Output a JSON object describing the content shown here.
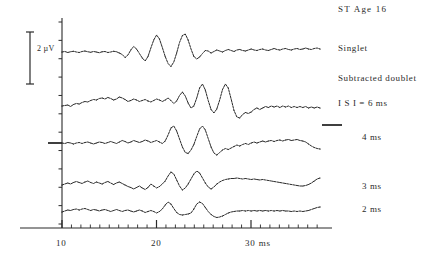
{
  "figure": {
    "title": "ST   Age 16",
    "background_color": "#ffffff",
    "ink_color": "#2a2a2a"
  },
  "scale_bar": {
    "label": "2 µV",
    "value": 2,
    "unit": "µV"
  },
  "axis": {
    "xlabel_suffix": "ms",
    "tick_labels": [
      "10",
      "20",
      "30 ms"
    ],
    "tick_values": [
      10,
      20,
      30
    ],
    "minor_tick_interval": 1,
    "x_range": [
      9,
      37
    ]
  },
  "trace_labels": [
    {
      "id": "singlet",
      "label": "Singlet"
    },
    {
      "id": "subtracted-doublet",
      "label": "Subtracted doublet"
    },
    {
      "id": "isi-6ms",
      "label": "I S I = 6 ms"
    },
    {
      "id": "isi-4ms",
      "label": "4 ms"
    },
    {
      "id": "isi-3ms",
      "label": "3 ms"
    },
    {
      "id": "isi-2ms",
      "label": "2 ms"
    }
  ],
  "chart_data": {
    "type": "line",
    "title": "ST   Age 16",
    "xlabel": "ms",
    "ylabel": "2 µV",
    "xlim": [
      9,
      37
    ],
    "grid": false,
    "legend": "right",
    "series": [
      {
        "name": "Singlet",
        "baseline_y": 52,
        "values": [
          0.0,
          0.1,
          -0.1,
          0.05,
          0.15,
          0.0,
          -0.1,
          0.1,
          0.2,
          0.05,
          -0.05,
          0.1,
          0.0,
          -0.15,
          0.05,
          0.1,
          -0.1,
          0.0,
          0.15,
          0.05,
          -0.2,
          -0.5,
          -1.1,
          -0.6,
          0.4,
          1.1,
          0.6,
          -0.3,
          -1.2,
          -1.8,
          -0.9,
          0.8,
          2.4,
          3.4,
          2.6,
          0.9,
          -0.9,
          -2.3,
          -2.9,
          -2.0,
          -0.2,
          1.9,
          3.3,
          3.6,
          2.4,
          0.6,
          -0.9,
          -1.4,
          -1.0,
          -0.3,
          0.3,
          0.2,
          -0.2,
          0.1,
          0.4,
          0.2,
          0.0,
          0.3,
          0.5,
          0.3,
          0.1,
          0.4,
          0.5,
          0.3,
          0.2,
          0.4,
          0.6,
          0.4,
          0.3,
          0.5,
          0.6,
          0.4,
          0.3,
          0.5,
          0.7,
          0.5,
          0.4,
          0.6,
          0.7,
          0.5,
          0.4,
          0.6,
          0.7,
          0.5,
          0.6,
          0.8,
          0.6,
          0.5,
          0.7,
          0.8,
          0.6
        ]
      },
      {
        "name": "I S I = 6 ms",
        "baseline_y": 105,
        "values": [
          -0.2,
          -0.1,
          0.0,
          -0.3,
          0.1,
          0.3,
          0.2,
          0.5,
          0.7,
          0.6,
          0.9,
          1.1,
          1.0,
          1.3,
          1.4,
          1.2,
          1.5,
          1.3,
          1.0,
          1.2,
          1.6,
          1.4,
          1.1,
          0.7,
          0.9,
          1.2,
          1.0,
          0.7,
          0.9,
          1.1,
          0.8,
          0.6,
          0.9,
          1.2,
          1.0,
          0.7,
          1.0,
          1.4,
          0.9,
          0.3,
          0.8,
          1.9,
          2.6,
          1.8,
          0.4,
          -0.6,
          -0.2,
          1.4,
          3.4,
          4.2,
          3.0,
          0.9,
          -0.9,
          -1.6,
          -0.8,
          1.0,
          3.1,
          4.2,
          3.4,
          1.2,
          -1.1,
          -2.4,
          -2.6,
          -1.9,
          -1.5,
          -1.7,
          -1.4,
          -0.9,
          -0.6,
          -0.9,
          -0.6,
          -0.3,
          -0.5,
          -0.2,
          -0.4,
          -0.2,
          -0.5,
          -0.2,
          -0.4,
          -0.2,
          -0.5,
          -0.3,
          -0.5,
          -0.3,
          -0.5,
          -0.3,
          -0.6,
          -0.4,
          -0.6,
          -0.4,
          -0.6
        ]
      },
      {
        "name": "4 ms",
        "baseline_y": 143,
        "has_right_marker": true,
        "has_left_marker": true,
        "values": [
          0.0,
          -0.1,
          0.1,
          0.0,
          -0.2,
          0.0,
          0.1,
          -0.1,
          0.1,
          0.2,
          0.0,
          -0.2,
          0.0,
          0.2,
          0.1,
          -0.1,
          0.1,
          0.3,
          0.1,
          -0.1,
          0.2,
          0.5,
          0.3,
          0.0,
          0.2,
          0.5,
          0.3,
          0.1,
          0.3,
          0.6,
          0.4,
          0.1,
          0.3,
          0.5,
          0.2,
          -0.1,
          0.4,
          1.6,
          3.0,
          3.4,
          2.4,
          0.8,
          -0.8,
          -1.9,
          -2.1,
          -1.4,
          -0.3,
          1.3,
          2.8,
          3.4,
          2.6,
          0.9,
          -0.8,
          -2.0,
          -2.4,
          -1.9,
          -1.4,
          -1.1,
          -1.3,
          -1.0,
          -0.7,
          -0.4,
          -0.6,
          -0.3,
          -0.1,
          -0.3,
          0.0,
          0.2,
          0.0,
          0.2,
          0.4,
          0.2,
          0.4,
          0.5,
          0.3,
          0.5,
          0.6,
          0.4,
          0.6,
          0.7,
          0.5,
          0.6,
          0.7,
          0.5,
          0.4,
          0.2,
          -0.2,
          -0.6,
          -0.9,
          -1.1,
          -1.2
        ]
      },
      {
        "name": "3 ms",
        "baseline_y": 185,
        "values": [
          0.0,
          0.2,
          0.4,
          0.2,
          0.5,
          0.7,
          0.5,
          0.3,
          0.6,
          0.8,
          0.5,
          0.3,
          0.6,
          0.4,
          0.2,
          0.5,
          0.7,
          0.4,
          0.1,
          0.4,
          0.6,
          0.3,
          0.0,
          -0.3,
          -0.5,
          -0.8,
          -0.5,
          -0.2,
          -0.6,
          -0.9,
          -0.5,
          0.2,
          -0.2,
          -0.6,
          -0.3,
          0.2,
          0.8,
          1.8,
          2.6,
          2.2,
          1.0,
          -0.2,
          -1.0,
          -0.6,
          0.2,
          1.2,
          2.2,
          2.8,
          2.4,
          1.4,
          0.4,
          -0.4,
          -0.8,
          -0.4,
          0.2,
          0.6,
          0.9,
          1.1,
          1.2,
          1.3,
          1.3,
          1.4,
          1.3,
          1.2,
          1.3,
          1.2,
          1.1,
          1.2,
          1.1,
          1.0,
          1.1,
          1.0,
          0.9,
          0.8,
          0.7,
          0.6,
          0.5,
          0.4,
          0.3,
          0.2,
          0.1,
          0.0,
          -0.1,
          -0.2,
          -0.2,
          -0.1,
          0.1,
          0.4,
          0.8,
          1.2,
          1.4
        ]
      },
      {
        "name": "2 ms",
        "baseline_y": 212,
        "values": [
          0.0,
          0.2,
          0.4,
          0.3,
          0.5,
          0.6,
          0.4,
          0.6,
          0.7,
          0.5,
          0.3,
          0.5,
          0.4,
          0.2,
          0.4,
          0.5,
          0.3,
          0.1,
          0.3,
          0.5,
          0.3,
          0.1,
          0.3,
          0.4,
          0.2,
          0.0,
          0.2,
          0.4,
          0.2,
          -0.1,
          0.1,
          0.3,
          0.1,
          -0.2,
          0.1,
          0.6,
          1.4,
          2.0,
          1.6,
          0.7,
          -0.1,
          -0.5,
          -0.6,
          -0.5,
          -0.4,
          -0.2,
          0.6,
          1.6,
          2.0,
          1.7,
          0.9,
          0.1,
          -0.5,
          -0.9,
          -1.1,
          -1.0,
          -0.8,
          -0.5,
          -0.2,
          0.0,
          0.1,
          0.2,
          0.2,
          0.3,
          0.2,
          0.3,
          0.2,
          0.3,
          0.2,
          0.3,
          0.2,
          0.3,
          0.2,
          0.3,
          0.2,
          0.3,
          0.2,
          0.3,
          0.2,
          0.2,
          0.1,
          0.2,
          0.1,
          0.2,
          0.1,
          0.2,
          0.3,
          0.5,
          0.7,
          0.9,
          1.0
        ]
      }
    ]
  }
}
